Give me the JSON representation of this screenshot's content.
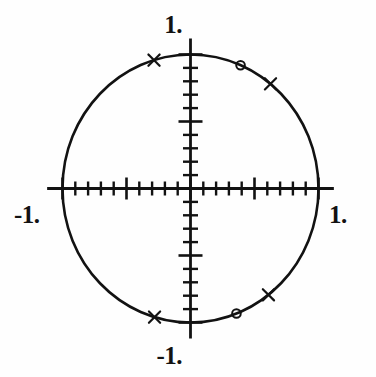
{
  "figure": {
    "title": "",
    "background_color": "#fefefe",
    "ink_color": "#121212"
  },
  "labels": {
    "y_max": "1.",
    "y_min": "-1.",
    "x_max": "1.",
    "x_min": "-1."
  },
  "chart_data": {
    "type": "scatter",
    "title": "",
    "xlabel": "",
    "ylabel": "",
    "xlim": [
      -1.12,
      1.12
    ],
    "ylim": [
      -1.12,
      1.12
    ],
    "grid": false,
    "legend": "none",
    "xtick_labels": [
      "-1.",
      "1."
    ],
    "ytick_labels": [
      "-1.",
      "1."
    ],
    "xticks": [
      -1.0,
      -0.9,
      -0.8,
      -0.7,
      -0.6,
      -0.5,
      -0.4,
      -0.3,
      -0.2,
      -0.1,
      0.0,
      0.1,
      0.2,
      0.3,
      0.4,
      0.5,
      0.6,
      0.7,
      0.8,
      0.9,
      1.0
    ],
    "yticks": [
      -1.0,
      -0.9,
      -0.8,
      -0.7,
      -0.6,
      -0.5,
      -0.4,
      -0.3,
      -0.2,
      -0.1,
      0.0,
      0.1,
      0.2,
      0.3,
      0.4,
      0.5,
      0.6,
      0.7,
      0.8,
      0.9,
      1.0
    ],
    "major_ticks": [
      -1.0,
      -0.5,
      0.0,
      0.5,
      1.0
    ],
    "curves": [
      {
        "name": "unit-circle",
        "shape": "circle",
        "center": [
          0.0,
          0.0
        ],
        "radius": 1.0
      }
    ],
    "series": [
      {
        "name": "poles",
        "marker": "x",
        "count": 4,
        "points": [
          {
            "x": -0.285,
            "y": 0.958,
            "angle_deg": 106.6
          },
          {
            "x": 0.625,
            "y": 0.781,
            "angle_deg": 51.3
          },
          {
            "x": 0.609,
            "y": -0.793,
            "angle_deg": -52.5
          },
          {
            "x": -0.281,
            "y": -0.96,
            "angle_deg": -106.3
          }
        ]
      },
      {
        "name": "zeros",
        "marker": "o",
        "count": 2,
        "points": [
          {
            "x": 0.391,
            "y": 0.92,
            "angle_deg": 67.0
          },
          {
            "x": 0.359,
            "y": -0.933,
            "angle_deg": -69.0
          }
        ]
      }
    ]
  }
}
